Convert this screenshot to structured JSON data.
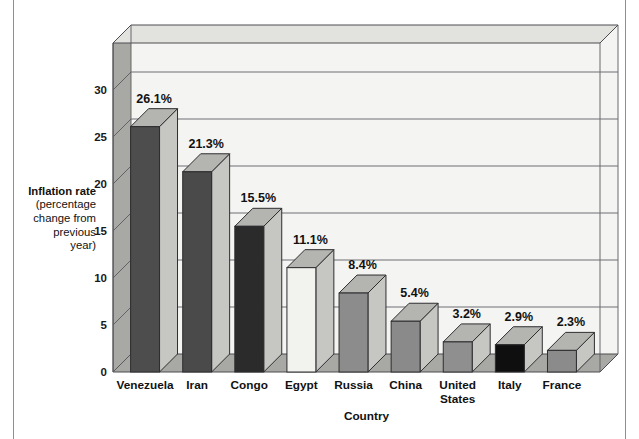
{
  "chart_data": {
    "type": "bar",
    "title": "",
    "xlabel": "Country",
    "ylabel": "Inflation rate (percentage change from previous year)",
    "ylabel_lines": [
      "Inflation rate",
      "(percentage",
      "change from",
      "previous",
      "year)"
    ],
    "categories": [
      "Venezuela",
      "Iran",
      "Congo",
      "Egypt",
      "Russia",
      "China",
      "United States",
      "Italy",
      "France"
    ],
    "category_lines": [
      [
        "Venezuela"
      ],
      [
        "Iran"
      ],
      [
        "Congo"
      ],
      [
        "Egypt"
      ],
      [
        "Russia"
      ],
      [
        "China"
      ],
      [
        "United",
        "States"
      ],
      [
        "Italy"
      ],
      [
        "France"
      ]
    ],
    "values": [
      26.1,
      21.3,
      15.5,
      11.1,
      8.4,
      5.4,
      3.2,
      2.9,
      2.3
    ],
    "data_labels": [
      "26.1%",
      "21.3%",
      "15.5%",
      "11.1%",
      "8.4%",
      "5.4%",
      "3.2%",
      "2.9%",
      "2.3%"
    ],
    "bar_colors": [
      "#4d4d4d",
      "#4a4a4a",
      "#2b2b2b",
      "#f2f2ee",
      "#8c8c8c",
      "#8a8a8a",
      "#8f8f8f",
      "#0f0f0f",
      "#8b8b8b"
    ],
    "ylim": [
      0,
      35
    ],
    "yticks": [
      0,
      5,
      10,
      15,
      20,
      25,
      30
    ],
    "ytick_labels": [
      "0",
      "5",
      "10",
      "15",
      "20",
      "25",
      "30"
    ],
    "grid": true,
    "legend": "none",
    "projection": "3d"
  },
  "style": {
    "plot_background": "#f4f4f2",
    "gridline_color": "#6f6f74",
    "wall_side_color": "#a8a8a4",
    "floor_color": "#a8a8a4",
    "bar_top_color": "#b4b4b0",
    "bar_side_color": "#c6c6c2",
    "page_rule_color": "#8f8f96",
    "text_color": "#111111"
  }
}
